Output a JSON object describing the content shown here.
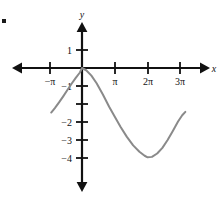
{
  "figure": {
    "background_color": "#ffffff",
    "axis_color": "#111111",
    "curve_color": "#8a8a8a",
    "corner_mark": "figure-corner-mark",
    "x_axis_label": "x",
    "y_axis_label": "y"
  },
  "chart_data": {
    "type": "line",
    "title": "",
    "xlabel": "x",
    "ylabel": "y",
    "grid": false,
    "legend": null,
    "xlim": [
      -4.4,
      10.8
    ],
    "ylim": [
      -5.1,
      1.9
    ],
    "x_tick_labels": [
      "−π",
      "π",
      "2π",
      "3π"
    ],
    "x_tick_values": [
      -3.14159,
      3.14159,
      6.28319,
      9.42478
    ],
    "y_tick_labels": [
      "1",
      "−1",
      "−2",
      "−3",
      "−4"
    ],
    "y_tick_values": [
      1,
      -1,
      -2,
      -3,
      -4
    ],
    "series": [
      {
        "name": "y = 2 cos(x/2) − 2",
        "color": "#8a8a8a",
        "x": [
          -2.95,
          -2.6,
          -2.2,
          -1.8,
          -1.4,
          -1.0,
          -0.6,
          -0.2,
          0.0,
          0.4,
          0.9,
          1.4,
          2.0,
          2.6,
          3.14159,
          3.7,
          4.3,
          4.9,
          5.5,
          6.0,
          6.28319,
          6.7,
          7.2,
          7.7,
          8.2,
          8.7,
          9.2,
          9.6,
          9.9
        ],
        "y": [
          -1.98,
          -1.78,
          -1.53,
          -1.26,
          -0.98,
          -0.7,
          -0.44,
          -0.2,
          0.0,
          -0.1,
          -0.34,
          -0.68,
          -1.18,
          -1.72,
          -2.17,
          -2.62,
          -3.06,
          -3.44,
          -3.72,
          -3.9,
          -3.97,
          -3.95,
          -3.8,
          -3.55,
          -3.2,
          -2.8,
          -2.38,
          -2.1,
          -1.95
        ]
      }
    ],
    "annotations": {
      "y_intercept": 0,
      "minimum_point": [
        6.28319,
        -4
      ],
      "left_endpoint": [
        -2.95,
        -2.0
      ],
      "right_endpoint": [
        9.9,
        -1.95
      ]
    }
  }
}
